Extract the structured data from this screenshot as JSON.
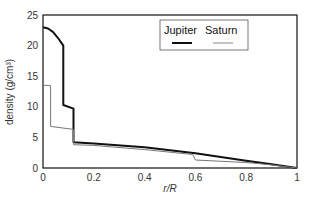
{
  "chart_data": {
    "type": "line",
    "title": "",
    "xlabel": "r/R",
    "ylabel": "density (g/cm³)",
    "xlim": [
      0,
      1
    ],
    "ylim": [
      0,
      25
    ],
    "grid": false,
    "legend_position": "top-center (inside plot)",
    "x_ticks": [
      "0",
      "0.2",
      "0.4",
      "0.6",
      "0.8",
      "1"
    ],
    "y_ticks": [
      "0",
      "5",
      "10",
      "15",
      "20",
      "25"
    ],
    "series": [
      {
        "name": "Jupiter",
        "style": "thick black",
        "color": "#111111",
        "x": [
          0,
          0.02,
          0.04,
          0.06,
          0.08,
          0.08,
          0.12,
          0.12,
          0.2,
          0.4,
          0.6,
          0.8,
          0.9,
          1.0
        ],
        "y": [
          23.0,
          22.8,
          22.2,
          21.2,
          20.0,
          10.3,
          9.7,
          4.2,
          4.0,
          3.4,
          2.4,
          1.2,
          0.6,
          0.0
        ]
      },
      {
        "name": "Saturn",
        "style": "thin gray",
        "color": "#777777",
        "x": [
          0,
          0.03,
          0.03,
          0.12,
          0.12,
          0.2,
          0.4,
          0.59,
          0.6,
          0.8,
          0.9,
          1.0
        ],
        "y": [
          13.5,
          13.5,
          6.8,
          6.3,
          3.8,
          3.7,
          3.0,
          2.2,
          1.3,
          0.9,
          0.5,
          0.0
        ]
      }
    ]
  },
  "legend": {
    "items": [
      {
        "label": "Jupiter"
      },
      {
        "label": "Saturn"
      }
    ]
  }
}
